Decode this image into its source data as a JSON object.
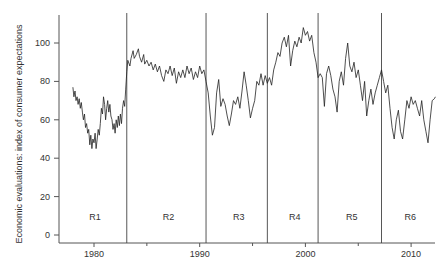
{
  "chart_data": {
    "type": "line",
    "title": "",
    "xlabel": "",
    "ylabel": "Economic evaluations: index of consumer expectations",
    "xlim": [
      1976.7,
      2012.4
    ],
    "ylim": [
      0,
      115
    ],
    "x_ticks": [
      1980,
      1990,
      2000,
      2010
    ],
    "x_tick_labels": [
      "1980",
      "1990",
      "2000",
      "2010"
    ],
    "x_minor_ticks": [
      1985,
      1995,
      2005
    ],
    "y_ticks": [
      0,
      20,
      40,
      60,
      80,
      100
    ],
    "y_tick_labels": [
      "0",
      "20",
      "40",
      "60",
      "80",
      "100"
    ],
    "grid": false,
    "legend": "none",
    "regions": [
      {
        "label": "R1",
        "start": 1976.7,
        "end": 1983.1
      },
      {
        "label": "R2",
        "start": 1983.1,
        "end": 1990.6
      },
      {
        "label": "R3",
        "start": 1990.6,
        "end": 1996.4
      },
      {
        "label": "R4",
        "start": 1996.4,
        "end": 2001.2
      },
      {
        "label": "R5",
        "start": 2001.2,
        "end": 2007.2
      },
      {
        "label": "R6",
        "start": 2007.2,
        "end": 2012.4
      }
    ],
    "boundaries": [
      1983.1,
      1990.6,
      1996.4,
      2001.2,
      2007.2
    ],
    "series": [
      {
        "name": "Index of consumer expectations",
        "color": "#222222",
        "points": [
          [
            1978.0,
            77
          ],
          [
            1978.1,
            72
          ],
          [
            1978.2,
            75
          ],
          [
            1978.3,
            70
          ],
          [
            1978.4,
            72
          ],
          [
            1978.5,
            68
          ],
          [
            1978.6,
            71
          ],
          [
            1978.7,
            66
          ],
          [
            1978.8,
            69
          ],
          [
            1978.9,
            64
          ],
          [
            1979.0,
            60
          ],
          [
            1979.1,
            63
          ],
          [
            1979.2,
            56
          ],
          [
            1979.3,
            58
          ],
          [
            1979.4,
            53
          ],
          [
            1979.5,
            55
          ],
          [
            1979.6,
            47
          ],
          [
            1979.7,
            52
          ],
          [
            1979.8,
            45
          ],
          [
            1979.9,
            50
          ],
          [
            1980.0,
            48
          ],
          [
            1980.1,
            53
          ],
          [
            1980.2,
            45
          ],
          [
            1980.3,
            50
          ],
          [
            1980.4,
            55
          ],
          [
            1980.5,
            52
          ],
          [
            1980.6,
            58
          ],
          [
            1980.7,
            66
          ],
          [
            1980.8,
            63
          ],
          [
            1980.9,
            72
          ],
          [
            1981.0,
            68
          ],
          [
            1981.1,
            60
          ],
          [
            1981.2,
            66
          ],
          [
            1981.3,
            70
          ],
          [
            1981.4,
            64
          ],
          [
            1981.5,
            68
          ],
          [
            1981.6,
            62
          ],
          [
            1981.7,
            60
          ],
          [
            1981.8,
            55
          ],
          [
            1981.9,
            58
          ],
          [
            1982.0,
            53
          ],
          [
            1982.1,
            60
          ],
          [
            1982.2,
            56
          ],
          [
            1982.3,
            62
          ],
          [
            1982.4,
            57
          ],
          [
            1982.5,
            63
          ],
          [
            1982.6,
            58
          ],
          [
            1982.7,
            66
          ],
          [
            1982.8,
            70
          ],
          [
            1982.9,
            67
          ],
          [
            1983.0,
            76
          ],
          [
            1983.1,
            85
          ],
          [
            1983.2,
            91
          ],
          [
            1983.4,
            88
          ],
          [
            1983.5,
            92
          ],
          [
            1983.7,
            96
          ],
          [
            1983.8,
            92
          ],
          [
            1984.0,
            94
          ],
          [
            1984.2,
            97
          ],
          [
            1984.3,
            93
          ],
          [
            1984.5,
            90
          ],
          [
            1984.7,
            94
          ],
          [
            1984.8,
            89
          ],
          [
            1985.0,
            91
          ],
          [
            1985.2,
            88
          ],
          [
            1985.4,
            90
          ],
          [
            1985.6,
            86
          ],
          [
            1985.8,
            89
          ],
          [
            1986.0,
            85
          ],
          [
            1986.2,
            88
          ],
          [
            1986.4,
            83
          ],
          [
            1986.6,
            80
          ],
          [
            1986.8,
            86
          ],
          [
            1987.0,
            84
          ],
          [
            1987.2,
            88
          ],
          [
            1987.4,
            83
          ],
          [
            1987.6,
            87
          ],
          [
            1987.8,
            79
          ],
          [
            1988.0,
            85
          ],
          [
            1988.2,
            82
          ],
          [
            1988.4,
            86
          ],
          [
            1988.6,
            82
          ],
          [
            1988.8,
            88
          ],
          [
            1989.0,
            84
          ],
          [
            1989.2,
            87
          ],
          [
            1989.4,
            81
          ],
          [
            1989.6,
            85
          ],
          [
            1989.8,
            82
          ],
          [
            1990.0,
            88
          ],
          [
            1990.2,
            84
          ],
          [
            1990.4,
            86
          ],
          [
            1990.6,
            80
          ],
          [
            1990.8,
            74
          ],
          [
            1991.0,
            62
          ],
          [
            1991.2,
            52
          ],
          [
            1991.4,
            56
          ],
          [
            1991.6,
            74
          ],
          [
            1991.8,
            81
          ],
          [
            1992.0,
            67
          ],
          [
            1992.2,
            71
          ],
          [
            1992.4,
            68
          ],
          [
            1992.6,
            62
          ],
          [
            1992.8,
            57
          ],
          [
            1993.0,
            63
          ],
          [
            1993.2,
            70
          ],
          [
            1993.4,
            68
          ],
          [
            1993.6,
            72
          ],
          [
            1993.8,
            66
          ],
          [
            1994.0,
            75
          ],
          [
            1994.2,
            85
          ],
          [
            1994.4,
            78
          ],
          [
            1994.6,
            70
          ],
          [
            1994.8,
            61
          ],
          [
            1995.0,
            66
          ],
          [
            1995.2,
            70
          ],
          [
            1995.4,
            80
          ],
          [
            1995.6,
            78
          ],
          [
            1995.8,
            84
          ],
          [
            1996.0,
            78
          ],
          [
            1996.2,
            83
          ],
          [
            1996.4,
            79
          ],
          [
            1996.6,
            82
          ],
          [
            1996.8,
            78
          ],
          [
            1997.0,
            86
          ],
          [
            1997.2,
            90
          ],
          [
            1997.4,
            95
          ],
          [
            1997.6,
            93
          ],
          [
            1997.8,
            100
          ],
          [
            1998.0,
            103
          ],
          [
            1998.2,
            98
          ],
          [
            1998.4,
            104
          ],
          [
            1998.6,
            88
          ],
          [
            1998.8,
            96
          ],
          [
            1999.0,
            101
          ],
          [
            1999.2,
            98
          ],
          [
            1999.4,
            103
          ],
          [
            1999.6,
            100
          ],
          [
            1999.8,
            108
          ],
          [
            2000.0,
            104
          ],
          [
            2000.2,
            106
          ],
          [
            2000.4,
            101
          ],
          [
            2000.6,
            104
          ],
          [
            2000.8,
            95
          ],
          [
            2001.0,
            90
          ],
          [
            2001.2,
            82
          ],
          [
            2001.4,
            84
          ],
          [
            2001.6,
            82
          ],
          [
            2001.8,
            67
          ],
          [
            2002.0,
            84
          ],
          [
            2002.2,
            88
          ],
          [
            2002.4,
            83
          ],
          [
            2002.6,
            76
          ],
          [
            2002.8,
            72
          ],
          [
            2003.0,
            64
          ],
          [
            2003.2,
            80
          ],
          [
            2003.4,
            85
          ],
          [
            2003.6,
            78
          ],
          [
            2003.8,
            92
          ],
          [
            2004.0,
            100
          ],
          [
            2004.2,
            88
          ],
          [
            2004.4,
            85
          ],
          [
            2004.6,
            90
          ],
          [
            2004.8,
            82
          ],
          [
            2005.0,
            86
          ],
          [
            2005.2,
            78
          ],
          [
            2005.4,
            70
          ],
          [
            2005.6,
            80
          ],
          [
            2005.8,
            62
          ],
          [
            2006.0,
            70
          ],
          [
            2006.2,
            76
          ],
          [
            2006.4,
            68
          ],
          [
            2006.6,
            74
          ],
          [
            2006.8,
            78
          ],
          [
            2007.0,
            82
          ],
          [
            2007.2,
            86
          ],
          [
            2007.4,
            80
          ],
          [
            2007.6,
            74
          ],
          [
            2007.8,
            78
          ],
          [
            2008.0,
            66
          ],
          [
            2008.2,
            56
          ],
          [
            2008.4,
            50
          ],
          [
            2008.6,
            60
          ],
          [
            2008.8,
            65
          ],
          [
            2009.0,
            54
          ],
          [
            2009.2,
            50
          ],
          [
            2009.4,
            60
          ],
          [
            2009.6,
            70
          ],
          [
            2009.8,
            66
          ],
          [
            2010.0,
            72
          ],
          [
            2010.2,
            68
          ],
          [
            2010.4,
            70
          ],
          [
            2010.6,
            66
          ],
          [
            2010.8,
            62
          ],
          [
            2011.0,
            70
          ],
          [
            2011.2,
            60
          ],
          [
            2011.4,
            54
          ],
          [
            2011.6,
            48
          ],
          [
            2011.8,
            60
          ],
          [
            2012.0,
            70
          ],
          [
            2012.2,
            71
          ],
          [
            2012.3,
            72
          ]
        ]
      }
    ]
  }
}
